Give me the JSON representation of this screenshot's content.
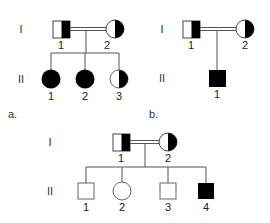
{
  "figure": {
    "colors": {
      "line": "#555555",
      "fill_affected": "#000000",
      "fill_unaffected": "#ffffff",
      "stroke": "#444444"
    },
    "pedigrees": [
      {
        "panel_label": "a.",
        "generation_labels": [
          "I",
          "II"
        ],
        "consanguineous": true,
        "generation_I": [
          {
            "number": "1",
            "sex": "male",
            "status": "carrier (half-filled)"
          },
          {
            "number": "2",
            "sex": "female",
            "status": "carrier (half-filled)"
          }
        ],
        "generation_II": [
          {
            "number": "1",
            "sex": "female",
            "status": "affected"
          },
          {
            "number": "2",
            "sex": "female",
            "status": "affected"
          },
          {
            "number": "3",
            "sex": "female",
            "status": "carrier (half-filled)"
          }
        ]
      },
      {
        "panel_label": "b.",
        "generation_labels": [
          "I",
          "II"
        ],
        "consanguineous": true,
        "generation_I": [
          {
            "number": "1",
            "sex": "male",
            "status": "carrier (half-filled)"
          },
          {
            "number": "2",
            "sex": "female",
            "status": "carrier (half-filled)"
          }
        ],
        "generation_II": [
          {
            "number": "1",
            "sex": "male",
            "status": "affected"
          }
        ]
      },
      {
        "panel_label": "",
        "generation_labels": [
          "I",
          "II"
        ],
        "consanguineous": true,
        "generation_I": [
          {
            "number": "1",
            "sex": "male",
            "status": "carrier (half-filled)"
          },
          {
            "number": "2",
            "sex": "female",
            "status": "carrier (half-filled)"
          }
        ],
        "generation_II": [
          {
            "number": "1",
            "sex": "male",
            "status": "unaffected"
          },
          {
            "number": "2",
            "sex": "female",
            "status": "unaffected"
          },
          {
            "number": "3",
            "sex": "male",
            "status": "unaffected"
          },
          {
            "number": "4",
            "sex": "male",
            "status": "affected"
          }
        ]
      }
    ]
  }
}
